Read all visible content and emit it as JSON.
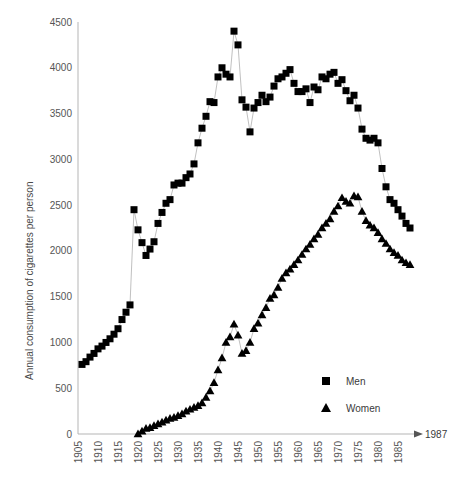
{
  "chart_data": {
    "type": "scatter",
    "title": "",
    "subtitle": "",
    "xlabel": "",
    "ylabel": "Annual consumption of cigarettes per person",
    "xlim": [
      1904,
      1988
    ],
    "ylim": [
      0,
      4500
    ],
    "grid": false,
    "legend_position": "inside-bottom-right",
    "x_tick_labels": [
      "1905",
      "1910",
      "1915",
      "1920",
      "1925",
      "1930",
      "1935",
      "1940",
      "1945",
      "1950",
      "1955",
      "1960",
      "1965",
      "1970",
      "1975",
      "1980",
      "1985"
    ],
    "x_tick_values": [
      1905,
      1910,
      1915,
      1920,
      1925,
      1930,
      1935,
      1940,
      1945,
      1950,
      1955,
      1960,
      1965,
      1970,
      1975,
      1980,
      1985
    ],
    "y_tick_labels": [
      "0",
      "500",
      "1000",
      "1500",
      "2000",
      "2500",
      "3000",
      "3500",
      "4000",
      "4500"
    ],
    "y_tick_values": [
      0,
      500,
      1000,
      1500,
      2000,
      2500,
      3000,
      3500,
      4000,
      4500
    ],
    "axis_end_annotation": "1987",
    "marker_color": "#000000",
    "line_color": "#b0b0b0",
    "axis_color": "#b5b5b5",
    "series": [
      {
        "name": "Men",
        "marker": "square",
        "x": [
          1905,
          1906,
          1907,
          1908,
          1909,
          1910,
          1911,
          1912,
          1913,
          1914,
          1915,
          1916,
          1917,
          1918,
          1919,
          1920,
          1921,
          1922,
          1923,
          1924,
          1925,
          1926,
          1927,
          1928,
          1929,
          1930,
          1931,
          1932,
          1933,
          1934,
          1935,
          1936,
          1937,
          1938,
          1939,
          1940,
          1941,
          1942,
          1943,
          1944,
          1945,
          1946,
          1947,
          1948,
          1949,
          1950,
          1951,
          1952,
          1953,
          1954,
          1955,
          1956,
          1957,
          1958,
          1959,
          1960,
          1961,
          1962,
          1963,
          1964,
          1965,
          1966,
          1967,
          1968,
          1969,
          1970,
          1971,
          1972,
          1973,
          1974,
          1975,
          1976,
          1977,
          1978,
          1979,
          1980,
          1981,
          1982,
          1983,
          1984,
          1985,
          1986,
          1987
        ],
        "y": [
          760,
          790,
          840,
          880,
          930,
          960,
          1000,
          1040,
          1090,
          1150,
          1250,
          1330,
          1410,
          2450,
          2230,
          2090,
          1950,
          2020,
          2100,
          2300,
          2420,
          2520,
          2560,
          2720,
          2740,
          2740,
          2800,
          2840,
          2950,
          3180,
          3340,
          3470,
          3630,
          3620,
          3900,
          4000,
          3930,
          3900,
          4400,
          4250,
          3650,
          3570,
          3300,
          3560,
          3620,
          3700,
          3630,
          3680,
          3800,
          3880,
          3900,
          3940,
          3980,
          3830,
          3740,
          3740,
          3770,
          3620,
          3790,
          3760,
          3900,
          3880,
          3930,
          3950,
          3830,
          3870,
          3750,
          3640,
          3700,
          3560,
          3330,
          3230,
          3210,
          3230,
          3180,
          2900,
          2700,
          2560,
          2520,
          2450,
          2380,
          2300,
          2250
        ]
      },
      {
        "name": "Women",
        "marker": "triangle",
        "x": [
          1919,
          1920,
          1921,
          1922,
          1923,
          1924,
          1925,
          1926,
          1927,
          1928,
          1929,
          1930,
          1931,
          1932,
          1933,
          1934,
          1935,
          1936,
          1937,
          1938,
          1939,
          1940,
          1941,
          1942,
          1943,
          1944,
          1945,
          1946,
          1947,
          1948,
          1949,
          1950,
          1951,
          1952,
          1953,
          1954,
          1955,
          1956,
          1957,
          1958,
          1959,
          1960,
          1961,
          1962,
          1963,
          1964,
          1965,
          1966,
          1967,
          1968,
          1969,
          1970,
          1971,
          1972,
          1973,
          1974,
          1975,
          1976,
          1977,
          1978,
          1979,
          1980,
          1981,
          1982,
          1983,
          1984,
          1985,
          1986,
          1987
        ],
        "y": [
          0,
          30,
          60,
          70,
          90,
          110,
          130,
          150,
          170,
          180,
          200,
          220,
          250,
          270,
          290,
          310,
          340,
          400,
          470,
          560,
          700,
          830,
          1000,
          1060,
          1200,
          1080,
          880,
          910,
          1000,
          1150,
          1210,
          1300,
          1380,
          1480,
          1520,
          1600,
          1700,
          1760,
          1800,
          1850,
          1900,
          1960,
          2020,
          2070,
          2130,
          2180,
          2250,
          2300,
          2350,
          2430,
          2490,
          2580,
          2540,
          2520,
          2600,
          2590,
          2430,
          2330,
          2280,
          2250,
          2200,
          2130,
          2080,
          2020,
          1980,
          1950,
          1900,
          1870,
          1850
        ]
      }
    ]
  },
  "legend": {
    "items": [
      {
        "label": "Men",
        "marker": "square"
      },
      {
        "label": "Women",
        "marker": "triangle"
      }
    ]
  }
}
